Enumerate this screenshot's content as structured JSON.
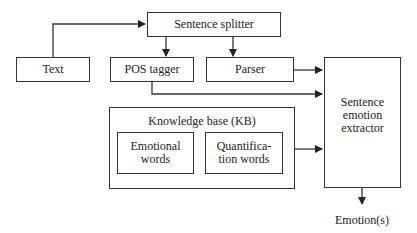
{
  "diagram": {
    "nodes": {
      "sentence_splitter": "Sentence splitter",
      "text": "Text",
      "pos_tagger": "POS tagger",
      "parser": "Parser",
      "knowledge_base": "Knowledge base (KB)",
      "emotional_words_l1": "Emotional",
      "emotional_words_l2": "words",
      "quantification_words_l1": "Quantifica-",
      "quantification_words_l2": "tion words",
      "extractor_l1": "Sentence",
      "extractor_l2": "emotion",
      "extractor_l3": "extractor",
      "output": "Emotion(s)"
    },
    "edges": [
      {
        "from": "Text",
        "to": "Sentence splitter"
      },
      {
        "from": "Sentence splitter",
        "to": "POS tagger"
      },
      {
        "from": "Sentence splitter",
        "to": "Parser"
      },
      {
        "from": "Parser",
        "to": "Sentence emotion extractor"
      },
      {
        "from": "POS tagger",
        "to": "Sentence emotion extractor"
      },
      {
        "from": "Knowledge base (KB)",
        "to": "Sentence emotion extractor"
      },
      {
        "from": "Sentence emotion extractor",
        "to": "Emotion(s)"
      }
    ],
    "colors": {
      "line": "#333333",
      "background": "#ffffff"
    }
  }
}
